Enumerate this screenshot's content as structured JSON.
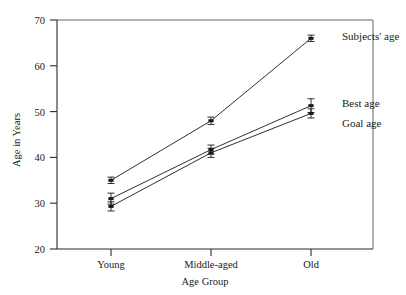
{
  "chart_data": {
    "type": "line",
    "title": "",
    "xlabel": "Age Group",
    "ylabel": "Age in Years",
    "categories": [
      "Young",
      "Middle-aged",
      "Old"
    ],
    "ylim": [
      20,
      70
    ],
    "yticks": [
      20,
      30,
      40,
      50,
      60,
      70
    ],
    "ytick_labels": [
      "20",
      "30",
      "40",
      "50",
      "60",
      "70"
    ],
    "grid": false,
    "legend_position": "inline-right",
    "series": [
      {
        "name": "Subjects' age",
        "values": [
          35.0,
          48.0,
          66.0
        ],
        "errors": [
          0.7,
          0.8,
          0.7
        ],
        "color": "#1a1a1a"
      },
      {
        "name": "Best age",
        "values": [
          31.0,
          41.7,
          51.3
        ],
        "errors": [
          1.2,
          1.0,
          1.5
        ],
        "color": "#1a1a1a"
      },
      {
        "name": "Goal age",
        "values": [
          29.3,
          41.0,
          49.6
        ],
        "errors": [
          1.0,
          1.0,
          1.0
        ],
        "color": "#1a1a1a"
      }
    ]
  },
  "labels": {
    "y_axis_title": "Age in Years",
    "x_axis_title": "Age Group",
    "y_tick_70": "70",
    "y_tick_60": "60",
    "y_tick_50": "50",
    "y_tick_40": "40",
    "y_tick_30": "30",
    "y_tick_20": "20",
    "cat_young": "Young",
    "cat_middle": "Middle-aged",
    "cat_old": "Old",
    "series_subjects": "Subjects' age",
    "series_best": "Best age",
    "series_goal": "Goal age"
  }
}
